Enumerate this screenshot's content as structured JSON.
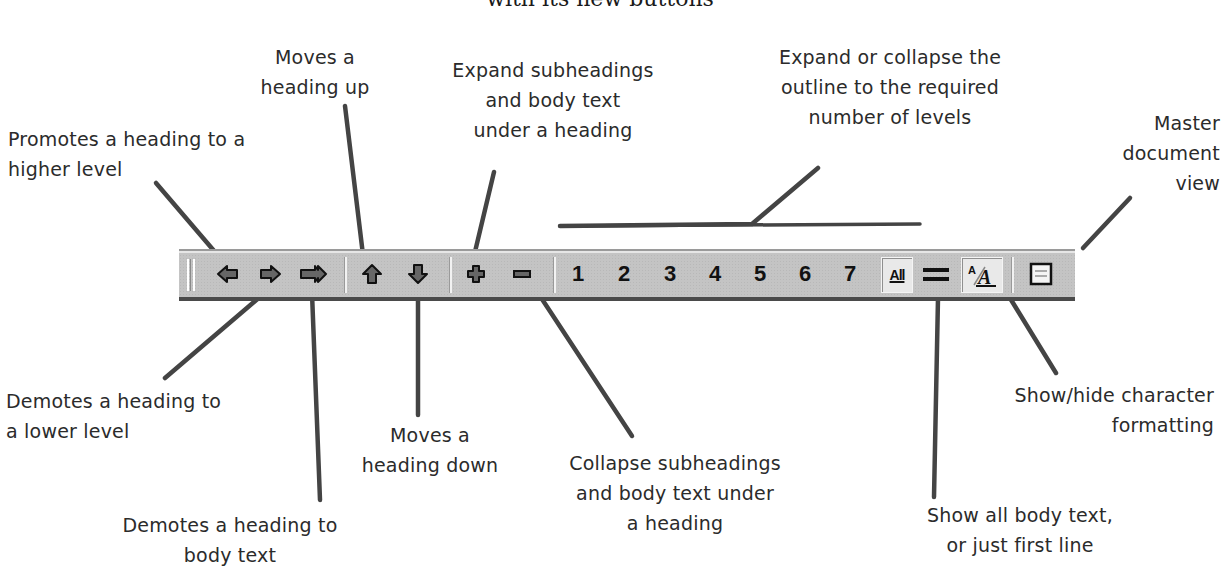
{
  "figure": {
    "title": "with its new buttons"
  },
  "callouts": {
    "promote": "Promotes a heading to a\nhigher level",
    "demote": "Demotes a heading to\na lower level",
    "demote_body": "Demotes a heading to\nbody text",
    "move_up": "Moves a\nheading up",
    "move_down": "Moves a\nheading down",
    "expand": "Expand subheadings\nand body text\nunder a heading",
    "collapse": "Collapse subheadings\nand body text under\na heading",
    "levels": "Expand or collapse the\noutline to the required\nnumber of levels",
    "show_first_line": "Show all body text,\nor just first line",
    "show_formatting": "Show/hide character\nformatting",
    "master_document": "Master\ndocument\nview"
  },
  "toolbar": {
    "buttons": [
      {
        "id": "promote",
        "icon": "arrow-left-icon"
      },
      {
        "id": "demote",
        "icon": "arrow-right-icon"
      },
      {
        "id": "demote-to-body",
        "icon": "double-arrow-right-icon"
      },
      {
        "id": "move-up",
        "icon": "arrow-up-icon"
      },
      {
        "id": "move-down",
        "icon": "arrow-down-icon"
      },
      {
        "id": "expand",
        "icon": "plus-icon"
      },
      {
        "id": "collapse",
        "icon": "minus-icon"
      },
      {
        "id": "show-all",
        "label": "All",
        "pressed": true
      },
      {
        "id": "show-first-line",
        "icon": "double-line-icon"
      },
      {
        "id": "show-formatting",
        "icon": "text-formatting-icon",
        "pressed": true
      },
      {
        "id": "master-document",
        "icon": "master-document-icon"
      }
    ],
    "levels": [
      "1",
      "2",
      "3",
      "4",
      "5",
      "6",
      "7"
    ],
    "all_label": "All",
    "colors": {
      "background": "#c4c4c4",
      "icon_fill": "#666666",
      "line": "#444444"
    }
  }
}
